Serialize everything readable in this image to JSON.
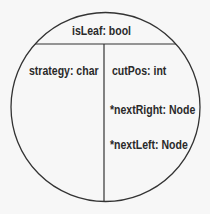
{
  "diagram": {
    "type": "node-structure-circle",
    "colors": {
      "background": "#f7f7f7",
      "stroke": "#333333",
      "text": "#2a2a2a"
    },
    "top_section": {
      "label": "isLeaf: bool"
    },
    "left_section": {
      "fields": [
        {
          "label": "strategy: char"
        }
      ]
    },
    "right_section": {
      "fields": [
        {
          "label": "cutPos: int"
        },
        {
          "label": "*nextRight: Node"
        },
        {
          "label": "*nextLeft: Node"
        }
      ]
    }
  }
}
